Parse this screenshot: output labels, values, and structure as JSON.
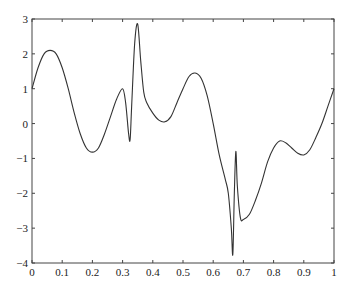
{
  "chart_data": {
    "type": "line",
    "title": "",
    "xlabel": "",
    "ylabel": "",
    "xlim": [
      0,
      1
    ],
    "ylim": [
      -4,
      3
    ],
    "grid": false,
    "legend": null,
    "x_ticks": [
      0,
      0.1,
      0.2,
      0.3,
      0.4,
      0.5,
      0.6,
      0.7,
      0.8,
      0.9,
      1
    ],
    "x_tick_labels": [
      "0",
      "0.1",
      "0.2",
      "0.3",
      "0.4",
      "0.5",
      "0.6",
      "0.7",
      "0.8",
      "0.9",
      "1"
    ],
    "y_ticks": [
      -4,
      -3,
      -2,
      -1,
      0,
      1,
      2,
      3
    ],
    "y_tick_labels": [
      "−4",
      "−3",
      "−2",
      "−1",
      "0",
      "1",
      "2",
      "3"
    ],
    "series": [
      {
        "name": "signal",
        "color": "#333333",
        "x": [
          0,
          0.02,
          0.04,
          0.06,
          0.08,
          0.1,
          0.12,
          0.14,
          0.16,
          0.18,
          0.2,
          0.22,
          0.24,
          0.26,
          0.28,
          0.3,
          0.31,
          0.32,
          0.325,
          0.33,
          0.34,
          0.35,
          0.36,
          0.37,
          0.38,
          0.4,
          0.42,
          0.44,
          0.46,
          0.48,
          0.5,
          0.52,
          0.54,
          0.56,
          0.58,
          0.6,
          0.62,
          0.64,
          0.65,
          0.66,
          0.665,
          0.67,
          0.675,
          0.68,
          0.69,
          0.7,
          0.72,
          0.74,
          0.76,
          0.78,
          0.8,
          0.82,
          0.84,
          0.86,
          0.88,
          0.9,
          0.92,
          0.94,
          0.96,
          0.98,
          1.0
        ],
        "y": [
          1.0,
          1.6,
          2.0,
          2.1,
          2.0,
          1.6,
          1.0,
          0.3,
          -0.3,
          -0.7,
          -0.82,
          -0.7,
          -0.3,
          0.2,
          0.7,
          1.0,
          0.6,
          -0.3,
          -0.45,
          0.5,
          2.3,
          2.85,
          1.8,
          0.9,
          0.6,
          0.3,
          0.1,
          0.05,
          0.2,
          0.6,
          1.0,
          1.35,
          1.45,
          1.3,
          0.8,
          0.0,
          -0.9,
          -1.6,
          -2.0,
          -3.0,
          -3.75,
          -2.0,
          -0.8,
          -1.8,
          -2.7,
          -2.75,
          -2.6,
          -2.2,
          -1.7,
          -1.1,
          -0.7,
          -0.5,
          -0.55,
          -0.7,
          -0.85,
          -0.9,
          -0.75,
          -0.4,
          0.0,
          0.5,
          1.0
        ]
      }
    ]
  }
}
